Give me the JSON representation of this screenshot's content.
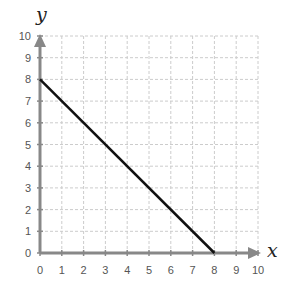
{
  "chart_data": {
    "type": "line",
    "title": "",
    "xlabel": "x",
    "ylabel": "y",
    "xlim": [
      0,
      10
    ],
    "ylim": [
      0,
      10
    ],
    "x_ticks": [
      0,
      1,
      2,
      3,
      4,
      5,
      6,
      7,
      8,
      9,
      10
    ],
    "y_ticks": [
      0,
      1,
      2,
      3,
      4,
      5,
      6,
      7,
      8,
      9,
      10
    ],
    "grid": true,
    "series": [
      {
        "name": "line",
        "x": [
          0,
          8
        ],
        "y": [
          8,
          0
        ],
        "color": "#111111"
      }
    ]
  },
  "colors": {
    "axis": "#888888",
    "grid": "#cccccc",
    "line": "#111111"
  }
}
